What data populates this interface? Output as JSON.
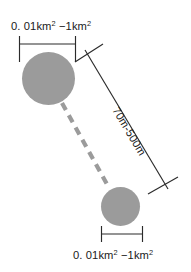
{
  "diagram": {
    "colors": {
      "patch_fill": "#9b9b9b",
      "line": "#2b2b2b",
      "corridor": "#9b9b9b",
      "background": "#ffffff",
      "text": "#1a1a1a"
    },
    "labels": {
      "top_patch_size": {
        "full": "0. 01km² −1km²",
        "lead": "0. 01km",
        "sup1": "2",
        "mid": " −1km",
        "sup2": "2"
      },
      "bottom_patch_size": {
        "full": "0. 01km² −1km²",
        "lead": "0. 01km",
        "sup1": "2",
        "mid": " −1km",
        "sup2": "2"
      },
      "corridor_length": {
        "full": "70m-500m"
      }
    },
    "elements": {
      "top_patch": {
        "name": "upper habitat patch",
        "cx": 48.5,
        "cy": 78.5,
        "r": 26.5
      },
      "bottom_patch": {
        "name": "lower habitat patch",
        "cx": 120.5,
        "cy": 206.5,
        "r": 19.5
      },
      "corridor": {
        "name": "dashed corridor link",
        "x1": 62,
        "y1": 103,
        "x2": 108,
        "y2": 186
      },
      "top_dimension": {
        "name": "upper patch width dimension",
        "x1": 19,
        "x2": 76,
        "y": 44
      },
      "bottom_dimension": {
        "name": "lower patch width dimension",
        "x1": 102,
        "x2": 142,
        "y": 234
      },
      "diagonal_dimension": {
        "name": "corridor length dimension",
        "x1": 85,
        "y1": 50,
        "x2": 168,
        "y2": 189
      }
    }
  }
}
